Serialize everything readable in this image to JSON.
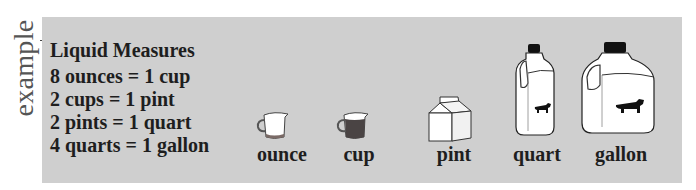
{
  "side_label": "example",
  "panel": {
    "background": "#cfcfcf",
    "title": "Liquid Measures",
    "facts": [
      "8 ounces = 1 cup",
      "2 cups = 1 pint",
      "2 pints = 1 quart",
      "4 quarts = 1 gallon"
    ],
    "items": [
      {
        "label": "ounce",
        "icon": "measuring-cup-low-icon"
      },
      {
        "label": "cup",
        "icon": "measuring-cup-full-icon"
      },
      {
        "label": "pint",
        "icon": "milk-carton-icon"
      },
      {
        "label": "quart",
        "icon": "milk-jug-small-icon"
      },
      {
        "label": "gallon",
        "icon": "milk-jug-large-icon"
      }
    ]
  }
}
